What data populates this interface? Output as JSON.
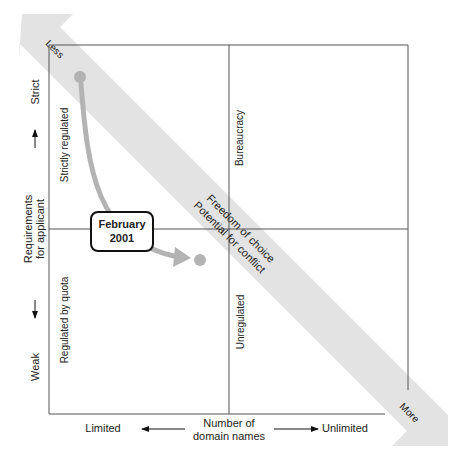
{
  "diagram": {
    "y_axis": {
      "title_line1": "Requirements",
      "title_line2": "for applicant",
      "top_label": "Strict",
      "bottom_label": "Weak"
    },
    "x_axis": {
      "title_line1": "Number of",
      "title_line2": "domain names",
      "left_label": "Limited",
      "right_label": "Unlimited"
    },
    "quadrants": {
      "top_left": "Strictly regulated",
      "top_right": "Bureaucracy",
      "bottom_left": "Regulated by quota",
      "bottom_right": "Unregulated"
    },
    "diagonal_arrow": {
      "start_label": "Less",
      "end_label": "More",
      "line1": "Freedom of choice",
      "line2": "Potential for conflict",
      "color": "#e3e3e3"
    },
    "transition": {
      "callout_line1": "February",
      "callout_line2": "2001",
      "point_color": "#b3b3b3",
      "arrow_color": "#b3b3b3"
    },
    "frame_color": "#555555"
  }
}
